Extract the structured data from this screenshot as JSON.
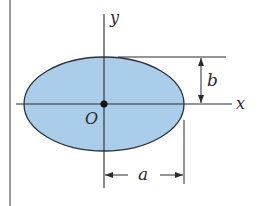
{
  "figure": {
    "colors": {
      "fill": "#aacdea",
      "stroke": "#2b2f3a",
      "axis": "#2a2a2a"
    },
    "labels": {
      "x_axis": "x",
      "y_axis": "y",
      "origin": "O",
      "semi_major": "a",
      "semi_minor": "b"
    }
  }
}
